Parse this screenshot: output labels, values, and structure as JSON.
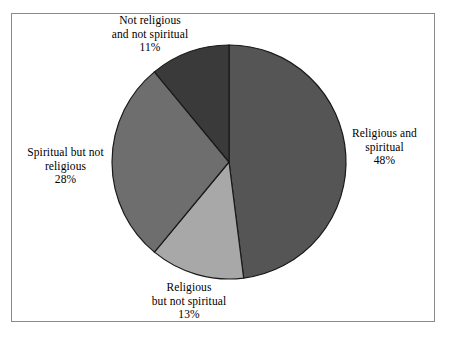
{
  "chart_data": {
    "type": "pie",
    "title": "",
    "subtitle": "",
    "xlabel": "",
    "ylabel": "",
    "legend_position": "none",
    "grid": false,
    "start_angle_deg": 0,
    "direction": "clockwise",
    "categories": [
      "Religious and spiritual",
      "Religious but not spiritual",
      "Spiritual but not religious",
      "Not religious and not spiritual"
    ],
    "values": [
      48,
      13,
      28,
      11
    ],
    "value_unit": "%",
    "slices": [
      {
        "name": "Religious and spiritual",
        "value": 48,
        "percent_label": "48%",
        "color": "#555555",
        "label_lines": [
          "Religious and",
          "spiritual"
        ]
      },
      {
        "name": "Religious but not spiritual",
        "value": 13,
        "percent_label": "13%",
        "color": "#a8a8a8",
        "label_lines": [
          "Religious",
          "but not spiritual"
        ]
      },
      {
        "name": "Spiritual but not religious",
        "value": 28,
        "percent_label": "28%",
        "color": "#6e6e6e",
        "label_lines": [
          "Spiritual but not",
          "religious"
        ]
      },
      {
        "name": "Not religious and not spiritual",
        "value": 11,
        "percent_label": "11%",
        "color": "#3a3a3a",
        "label_lines": [
          "Not religious",
          "and not spiritual"
        ]
      }
    ]
  },
  "figure": {
    "background_color": "#ffffff",
    "border_color": "#8a8a8a",
    "slice_outline_color": "#1a1a1a",
    "center_x": 229,
    "center_y": 162,
    "radius": 117
  },
  "labels": {
    "religious_and_spiritual": {
      "line1": "Religious and",
      "line2": "spiritual",
      "percent": "48%"
    },
    "religious_but_not_spiritual": {
      "line1": "Religious",
      "line2": "but not spiritual",
      "percent": "13%"
    },
    "spiritual_but_not_religious": {
      "line1": "Spiritual but not",
      "line2": "religious",
      "percent": "28%"
    },
    "not_religious_and_not_spiritual": {
      "line1": "Not religious",
      "line2": "and not spiritual",
      "percent": "11%"
    }
  }
}
